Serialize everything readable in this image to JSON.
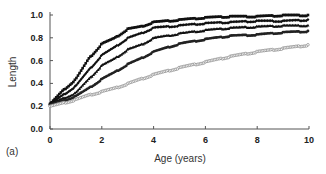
{
  "panel_label": "(a)",
  "chart_data": {
    "type": "line",
    "title": "",
    "xlabel": "Age (years)",
    "ylabel": "Length",
    "xlim": [
      0,
      10
    ],
    "ylim": [
      0,
      1.0
    ],
    "x_ticks": [
      0,
      2,
      4,
      6,
      8,
      10
    ],
    "y_ticks": [
      0.0,
      0.2,
      0.4,
      0.6,
      0.8,
      1.0
    ],
    "x_tick_labels": [
      "0",
      "2",
      "4",
      "6",
      "8",
      "10"
    ],
    "y_tick_labels": [
      "0.0",
      "0.2",
      "0.4",
      "0.6",
      "0.8",
      "1.0"
    ],
    "grid": false,
    "legend": null,
    "x": [
      0,
      0.5,
      1,
      1.5,
      2,
      2.5,
      3,
      3.5,
      4,
      5,
      6,
      7,
      8,
      9,
      10
    ],
    "series": [
      {
        "name": "curve-1",
        "marker": "filled-square",
        "color": "#111111",
        "values": [
          0.22,
          0.34,
          0.44,
          0.62,
          0.75,
          0.8,
          0.88,
          0.9,
          0.94,
          0.96,
          0.98,
          0.99,
          0.99,
          1.0,
          1.0
        ]
      },
      {
        "name": "curve-2",
        "marker": "filled-diamond",
        "color": "#111111",
        "values": [
          0.22,
          0.3,
          0.38,
          0.52,
          0.65,
          0.72,
          0.8,
          0.84,
          0.89,
          0.91,
          0.93,
          0.94,
          0.95,
          0.95,
          0.96
        ]
      },
      {
        "name": "curve-3",
        "marker": "filled-triangle",
        "color": "#111111",
        "values": [
          0.22,
          0.27,
          0.32,
          0.44,
          0.56,
          0.62,
          0.7,
          0.74,
          0.8,
          0.84,
          0.87,
          0.89,
          0.9,
          0.91,
          0.91
        ]
      },
      {
        "name": "curve-4",
        "marker": "filled-circle",
        "color": "#222222",
        "values": [
          0.21,
          0.25,
          0.29,
          0.36,
          0.44,
          0.5,
          0.57,
          0.62,
          0.68,
          0.75,
          0.79,
          0.82,
          0.83,
          0.85,
          0.86
        ]
      },
      {
        "name": "curve-5",
        "marker": "open-circle",
        "color": "#888888",
        "values": [
          0.2,
          0.23,
          0.26,
          0.3,
          0.33,
          0.36,
          0.4,
          0.44,
          0.48,
          0.54,
          0.59,
          0.64,
          0.68,
          0.71,
          0.74
        ]
      }
    ]
  }
}
